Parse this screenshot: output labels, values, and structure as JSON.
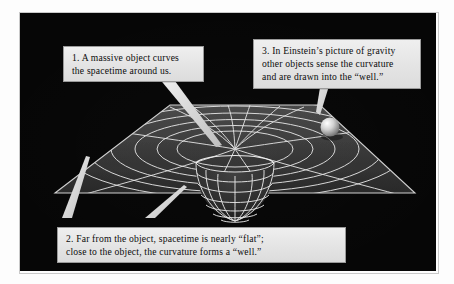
{
  "figure": {
    "background_color": "#060606",
    "grid_color": "#e8e8e8",
    "surface_fill": "#3a3a3a",
    "callout_bg": "#e7e7e7",
    "callout_text_color": "#0b0b0b"
  },
  "callouts": [
    {
      "id": "callout-1",
      "number": "1.",
      "line1": "1.  A massive object curves",
      "line2": "the spacetime around us.",
      "text": "1.  A massive object curves\nthe spacetime around us."
    },
    {
      "id": "callout-2",
      "number": "2.",
      "line1": "2.  Far from the object, spacetime is nearly “flat”;",
      "line2": "close to the object, the curvature forms a “well.”",
      "text": "2.  Far from the object, spacetime is nearly “flat”;\nclose to the object, the curvature forms a “well.”"
    },
    {
      "id": "callout-3",
      "number": "3.",
      "line1": "3.  In Einstein’s picture of gravity",
      "line2": "other objects sense the curvature",
      "line3": "and are drawn into the “well.”",
      "text": "3.  In Einstein’s picture of gravity\nother objects sense the curvature\nand are drawn into the “well.”"
    }
  ],
  "scene_elements": {
    "spacetime_sheet": "spacetime-grid-sheet",
    "gravity_well": "gravity-well-funnel",
    "test_mass": "orbiting-sphere",
    "leader_lines": [
      "leader-callout-1-to-well",
      "leader-callout-2-to-flat-region",
      "leader-callout-2-to-well-rim",
      "leader-callout-3-to-sphere"
    ]
  }
}
